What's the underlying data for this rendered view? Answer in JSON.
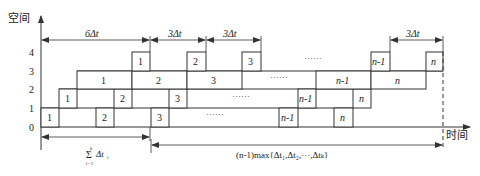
{
  "axes": {
    "y_label": "空间",
    "x_label": "时间",
    "y_ticks": [
      "0",
      "1",
      "2",
      "3",
      "4"
    ]
  },
  "top_dimensions": [
    {
      "label_pre": "6",
      "label": "Δt"
    },
    {
      "label_pre": "3",
      "label": "Δt"
    },
    {
      "label_pre": "3",
      "label": "Δt"
    },
    {
      "label_pre": "3",
      "label": "Δt"
    }
  ],
  "levels": [
    {
      "level": 0,
      "boxes": [
        "1",
        "2",
        "3",
        "n-1",
        "n"
      ]
    },
    {
      "level": 1,
      "boxes": [
        "1",
        "2",
        "3",
        "n-1",
        "n"
      ]
    },
    {
      "level": 2,
      "boxes": [
        "1",
        "2",
        "3",
        "n-1",
        "n"
      ]
    },
    {
      "level": 3,
      "boxes": [
        "1",
        "2",
        "3",
        "n-1",
        "n"
      ]
    }
  ],
  "ellipsis": "······",
  "bottom_dimensions": {
    "sum_label": {
      "symbol": "Σ",
      "upper": "k",
      "lower": "i=1",
      "term": "Δt",
      "term_sub": "i"
    },
    "max_label": "(n-1)max{Δt₁,Δt₂,···,Δtₖ}"
  }
}
